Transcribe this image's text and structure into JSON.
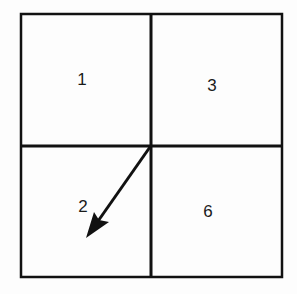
{
  "diagram": {
    "cells": [
      {
        "label": "1",
        "position": "top-left"
      },
      {
        "label": "3",
        "position": "top-right"
      },
      {
        "label": "2",
        "position": "bottom-left"
      },
      {
        "label": "6",
        "position": "bottom-right"
      }
    ],
    "arrow": {
      "from": "center",
      "to": "cell-2",
      "direction": "down-left"
    },
    "colors": {
      "line": "#111111",
      "background": "#fdfdfd"
    }
  }
}
